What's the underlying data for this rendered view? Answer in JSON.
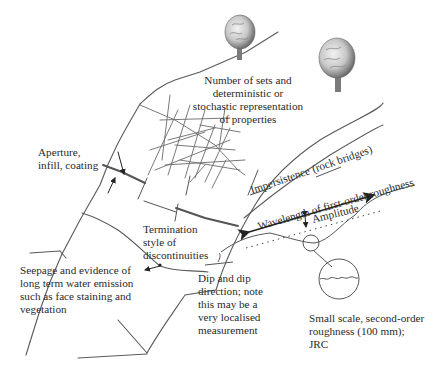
{
  "diagram": {
    "type": "annotated rock-mass discontinuity sketch",
    "labels": {
      "sets": [
        "Number of sets and",
        "deterministic or",
        "stochastic representation",
        "of properties"
      ],
      "aperture": [
        "Aperture,",
        "infill, coating"
      ],
      "impersistence": "Impersistence (rock bridges)",
      "wavelength": "Wavelength of first-order roughness",
      "amplitude": "Amplitude",
      "termination": [
        "Termination",
        "style of",
        "discontinuities"
      ],
      "seepage": [
        "Seepage and evidence of",
        "long term water emission",
        "such as face staining and",
        "vegetation"
      ],
      "dip": [
        "Dip and dip",
        "direction; note",
        "this may be a",
        "very localised",
        "measurement"
      ],
      "small_scale": [
        "Small scale, second-order",
        "roughness (100 mm);",
        "JRC"
      ]
    },
    "icons": {
      "tree_left": "tree-icon",
      "tree_right": "tree-icon",
      "magnifier": "magnified-detail-circle"
    },
    "colors": {
      "line": "#555555",
      "text": "#2a2a2a",
      "tree_light": "#d8d8d8",
      "tree_dark": "#6a6a6a",
      "trunk": "#7a7a7a"
    }
  }
}
